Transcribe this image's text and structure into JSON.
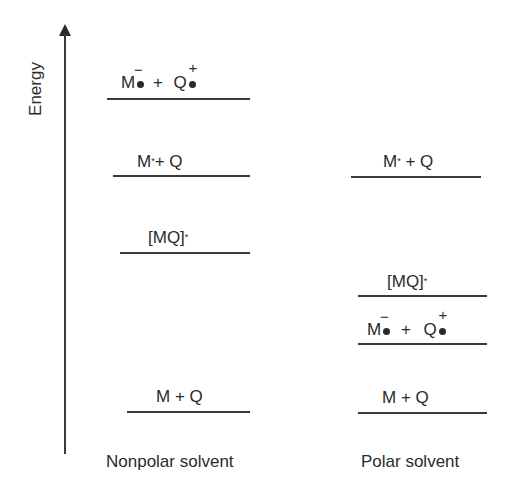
{
  "diagram": {
    "type": "energy-level-diagram",
    "y_axis": {
      "label": "Energy",
      "direction": "up"
    },
    "columns": [
      {
        "label": "Nonpolar solvent",
        "levels": [
          {
            "id": "radical_ion_pair",
            "species1": "M",
            "charge1": "−",
            "plus": "+",
            "species2": "Q",
            "charge2": "+",
            "rank": 1
          },
          {
            "id": "excited_plus_quencher",
            "text": "M",
            "sup": "*",
            "rest": "+ Q",
            "rank": 2
          },
          {
            "id": "exciplex",
            "text": "[MQ]",
            "sup": "*",
            "rank": 3
          },
          {
            "id": "ground_state",
            "text": "M + Q",
            "rank": 4
          }
        ]
      },
      {
        "label": "Polar solvent",
        "levels": [
          {
            "id": "excited_plus_quencher",
            "text": "M",
            "sup": "*",
            "rest": " + Q",
            "rank": 1
          },
          {
            "id": "exciplex",
            "text": "[MQ]",
            "sup": "*",
            "rank": 2
          },
          {
            "id": "radical_ion_pair",
            "species1": "M",
            "charge1": "−",
            "plus": "+",
            "species2": "Q",
            "charge2": "+",
            "rank": 3
          },
          {
            "id": "ground_state",
            "text": "M + Q",
            "rank": 4
          }
        ]
      }
    ]
  }
}
